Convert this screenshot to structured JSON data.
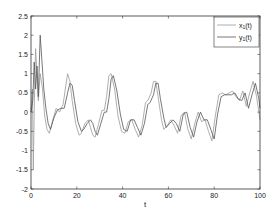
{
  "chart_data": {
    "type": "line",
    "title": "",
    "xlabel": "t",
    "ylabel": "",
    "xlim": [
      0,
      100
    ],
    "ylim": [
      -2,
      2.5
    ],
    "xticks": [
      0,
      20,
      40,
      60,
      80,
      100
    ],
    "xtick_labels": [
      "0",
      "20",
      "40",
      "60",
      "80",
      "100"
    ],
    "yticks": [
      -2,
      -1.5,
      -1,
      -0.5,
      0,
      0.5,
      1,
      1.5,
      2,
      2.5
    ],
    "ytick_labels": [
      "-2",
      "-1.5",
      "-1",
      "-0.5",
      "0",
      "0.5",
      "1",
      "1.5",
      "2",
      "2.5"
    ],
    "grid": false,
    "legend_position": "upper right",
    "series": [
      {
        "name": "x1(t)",
        "legend_label": "x",
        "legend_sub": "1",
        "legend_suffix": "(t)",
        "color": "#9a9a9a",
        "x": [
          0,
          0.6,
          1.0,
          1.5,
          2.0,
          2.6,
          3.2,
          4.0,
          5.0,
          6.0,
          7.0,
          8.0,
          9.5,
          11.0,
          12.5,
          14.0,
          15.0,
          16.0,
          17.0,
          18.0,
          19.5,
          21.0,
          22.0,
          23.5,
          25.0,
          26.0,
          27.0,
          28.0,
          29.5,
          31.0,
          32.0,
          33.0,
          34.0,
          35.0,
          36.5,
          38.0,
          39.5,
          41.0,
          42.5,
          44.0,
          45.5,
          47.0,
          48.5,
          50.0,
          51.0,
          52.5,
          53.5,
          54.5,
          55.5,
          57.0,
          58.0,
          59.5,
          61.0,
          62.5,
          64.0,
          65.5,
          67.0,
          68.5,
          70.0,
          71.5,
          73.0,
          74.5,
          76.0,
          77.5,
          79.0,
          80.5,
          82.0,
          83.5,
          85.0,
          86.5,
          88.0,
          89.5,
          91.0,
          92.5,
          94.0,
          95.5,
          97.0,
          98.5,
          100.0
        ],
        "values": [
          0.0,
          0.6,
          -1.5,
          0.3,
          1.65,
          1.0,
          0.3,
          1.0,
          0.6,
          -0.1,
          -0.45,
          -0.55,
          -0.2,
          0.1,
          0.0,
          0.2,
          0.6,
          1.0,
          0.8,
          0.3,
          -0.3,
          -0.6,
          -0.55,
          -0.3,
          -0.2,
          -0.4,
          -0.6,
          -0.65,
          -0.3,
          0.05,
          0.05,
          0.4,
          0.95,
          1.0,
          0.6,
          -0.1,
          -0.5,
          -0.55,
          -0.25,
          -0.2,
          -0.45,
          -0.65,
          -0.35,
          0.25,
          0.3,
          0.5,
          0.8,
          0.8,
          0.4,
          -0.2,
          -0.45,
          -0.35,
          -0.2,
          -0.35,
          -0.55,
          -0.1,
          0.0,
          -0.45,
          -0.7,
          -0.3,
          0.0,
          -0.25,
          -0.2,
          -0.5,
          -0.75,
          -0.1,
          0.45,
          0.5,
          0.45,
          0.5,
          0.55,
          0.4,
          0.3,
          0.55,
          0.15,
          0.5,
          0.8,
          0.4,
          -0.2
        ]
      },
      {
        "name": "y1(t)",
        "legend_label": "y",
        "legend_sub": "1",
        "legend_suffix": "(t)",
        "color": "#555555",
        "x": [
          0,
          0.8,
          1.4,
          2.0,
          2.6,
          3.2,
          4.0,
          4.8,
          5.6,
          6.5,
          7.5,
          8.5,
          10.0,
          11.5,
          13.0,
          14.5,
          16.0,
          17.0,
          18.0,
          19.0,
          20.5,
          22.0,
          23.0,
          24.5,
          26.0,
          27.0,
          28.0,
          29.0,
          30.5,
          32.0,
          33.0,
          34.0,
          35.0,
          36.0,
          37.5,
          39.0,
          40.5,
          42.0,
          43.5,
          45.0,
          46.5,
          48.0,
          49.5,
          51.0,
          52.0,
          53.5,
          54.5,
          55.5,
          56.5,
          58.0,
          59.0,
          60.5,
          62.0,
          63.5,
          65.0,
          66.5,
          68.0,
          69.5,
          71.0,
          72.5,
          74.0,
          75.5,
          77.0,
          78.5,
          80.0,
          81.5,
          83.0,
          84.5,
          86.0,
          87.5,
          89.0,
          90.5,
          92.0,
          93.5,
          95.0,
          96.5,
          98.0,
          99.5,
          100.0
        ],
        "values": [
          0.0,
          0.3,
          1.3,
          0.6,
          1.2,
          0.4,
          2.0,
          1.3,
          0.6,
          0.1,
          -0.3,
          -0.45,
          -0.15,
          0.05,
          0.1,
          0.1,
          0.5,
          0.75,
          0.7,
          0.3,
          -0.25,
          -0.5,
          -0.45,
          -0.3,
          -0.2,
          -0.3,
          -0.5,
          -0.6,
          -0.3,
          0.0,
          0.0,
          0.35,
          0.85,
          0.95,
          0.55,
          -0.05,
          -0.45,
          -0.5,
          -0.2,
          -0.2,
          -0.4,
          -0.6,
          -0.3,
          0.2,
          0.25,
          0.45,
          0.75,
          0.75,
          0.35,
          -0.15,
          -0.4,
          -0.3,
          -0.2,
          -0.3,
          -0.5,
          -0.05,
          0.0,
          -0.4,
          -0.65,
          -0.25,
          0.0,
          -0.2,
          -0.2,
          -0.45,
          -0.7,
          -0.05,
          0.4,
          0.45,
          0.45,
          0.45,
          0.5,
          0.35,
          0.3,
          0.5,
          0.1,
          0.45,
          0.75,
          0.35,
          0.1
        ]
      }
    ]
  }
}
